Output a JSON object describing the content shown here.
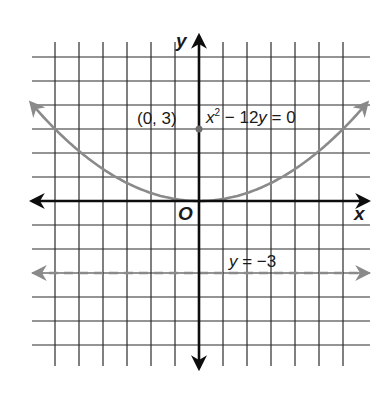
{
  "figure": {
    "type": "coordinate-plane",
    "axes": {
      "x_label": "x",
      "y_label": "y",
      "origin_label": "O"
    },
    "grid": {
      "unit_px": 24,
      "origin_px": [
        199,
        201
      ],
      "x_range": [
        -6,
        6
      ],
      "y_range": [
        -6,
        6
      ]
    },
    "parabola": {
      "equation_parts": {
        "lhs_var": "x",
        "exp": "2",
        "rest": " − 12",
        "var2": "y",
        "rhs": " = 0"
      },
      "equation_text": "x² − 12y = 0",
      "color": "#8a8a8a",
      "x_domain": [
        -7,
        7
      ]
    },
    "focus_point": {
      "label": "(0, 3)",
      "x": 0,
      "y": 3,
      "color": "#6e6e6e"
    },
    "directrix": {
      "label_var": "y",
      "label_rest": " = −3",
      "equation_text": "y = −3",
      "y": -3,
      "style": "dashed",
      "color": "#8a8a8a"
    },
    "colors": {
      "grid": "#2a2a2a",
      "axis": "#0d0d0d",
      "background": "#ffffff"
    }
  }
}
